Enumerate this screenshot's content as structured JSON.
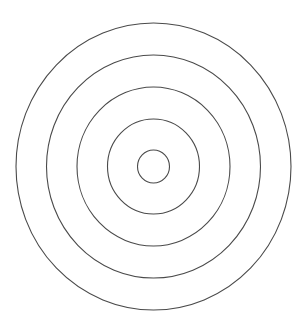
{
  "diagram": {
    "type": "concentric-rings",
    "background": "#ffffff",
    "stroke_color": "#4a4a4a",
    "stroke_width": 1.1,
    "center": {
      "x": 153.5,
      "y": 166.5
    },
    "rings": [
      {
        "name": "ring-1-innermost",
        "rx": 16,
        "ry": 16.5
      },
      {
        "name": "ring-2",
        "rx": 46,
        "ry": 47.5
      },
      {
        "name": "ring-3",
        "rx": 76.5,
        "ry": 79.5
      },
      {
        "name": "ring-4",
        "rx": 107,
        "ry": 111.5
      },
      {
        "name": "ring-5-outermost",
        "rx": 137.5,
        "ry": 143.5
      }
    ]
  }
}
